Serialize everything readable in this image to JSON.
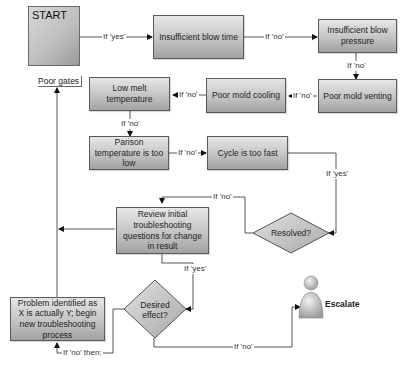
{
  "diagram": {
    "type": "troubleshooting-flowchart",
    "start": {
      "title": "START",
      "caption": "Poor gates"
    },
    "nodes": [
      {
        "id": "n1",
        "label": "Insufficient blow time"
      },
      {
        "id": "n2",
        "label": "Insufficient blow pressure"
      },
      {
        "id": "n3",
        "label": "Poor mold venting"
      },
      {
        "id": "n4",
        "label": "Poor mold cooling"
      },
      {
        "id": "n5",
        "label": "Low melt temperature"
      },
      {
        "id": "n6",
        "label": "Parison temperature is too low"
      },
      {
        "id": "n7",
        "label": "Cycle is too fast"
      },
      {
        "id": "n8",
        "label": "Review initial troubleshooting questions for change in result"
      },
      {
        "id": "n9",
        "label": "Problem identified as X is actually Y; begin new troubleshooting process"
      }
    ],
    "decisions": [
      {
        "id": "d1",
        "label": "Resolved?"
      },
      {
        "id": "d2",
        "label": "Desired effect?"
      }
    ],
    "terminal": {
      "id": "esc",
      "label": "Escalate",
      "icon": "person-icon"
    },
    "edges": [
      {
        "from": "start",
        "to": "n1",
        "label": "If 'yes'"
      },
      {
        "from": "n1",
        "to": "n2",
        "label": "If 'no'"
      },
      {
        "from": "n2",
        "to": "n3",
        "label": "If 'no'"
      },
      {
        "from": "n3",
        "to": "n4",
        "label": "If 'no'"
      },
      {
        "from": "n4",
        "to": "n5",
        "label": "If 'no'"
      },
      {
        "from": "n5",
        "to": "n6",
        "label": "If 'no'"
      },
      {
        "from": "n6",
        "to": "n7",
        "label": "If 'no'"
      },
      {
        "from": "n7",
        "to": "d1",
        "label": "If 'yes'"
      },
      {
        "from": "d1",
        "to": "n8",
        "label": "If 'no'"
      },
      {
        "from": "n8",
        "to": "d2",
        "label": "If 'yes'"
      },
      {
        "from": "d2",
        "to": "n9",
        "label": "If 'no' then:"
      },
      {
        "from": "d2",
        "to": "esc",
        "label": "If 'no'"
      },
      {
        "from": "n9",
        "to": "start",
        "label": ""
      }
    ]
  }
}
